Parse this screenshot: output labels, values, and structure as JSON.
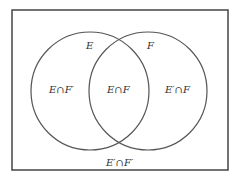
{
  "diagram": {
    "type": "venn",
    "sets": [
      {
        "name": "E",
        "label": "E"
      },
      {
        "name": "F",
        "label": "F"
      }
    ],
    "regions": {
      "e_only": "E∩F′",
      "both": "E∩F",
      "f_only": "E′∩F",
      "neither": "E′∩F′"
    },
    "colors": {
      "stroke": "#444444",
      "text": "#333333",
      "background": "#ffffff"
    }
  }
}
